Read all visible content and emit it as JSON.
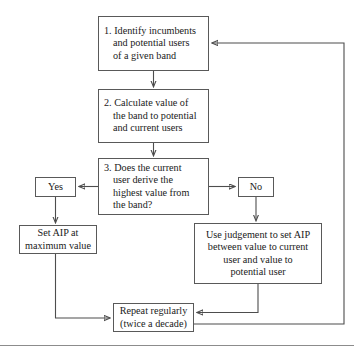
{
  "diagram": {
    "type": "flowchart",
    "background_color": "#ffffff",
    "border_color": "#595959",
    "line_color": "#4d4d4d",
    "text_color": "#1a1a1a",
    "nodes": [
      {
        "id": "identify",
        "label": "1. Identify incumbents\nand potential users\nof a given band",
        "shape": "rectangle",
        "role": "process"
      },
      {
        "id": "calculate",
        "label": "2. Calculate value of\nthe band to potential\nand current users",
        "shape": "rectangle",
        "role": "process"
      },
      {
        "id": "decision",
        "label": "3. Does the current\nuser derive the\nhighest value from\nthe band?",
        "shape": "rectangle",
        "role": "decision"
      },
      {
        "id": "yes",
        "label": "Yes",
        "shape": "rectangle",
        "role": "branch-label"
      },
      {
        "id": "no",
        "label": "No",
        "shape": "rectangle",
        "role": "branch-label"
      },
      {
        "id": "setaip",
        "label": "Set AIP at\nmaximum value",
        "shape": "rectangle",
        "role": "action"
      },
      {
        "id": "judgement",
        "label": "Use judgement to set AIP\nbetween value to current\nuser and value to\npotential user",
        "shape": "rectangle",
        "role": "action"
      },
      {
        "id": "repeat",
        "label": "Repeat regularly\n(twice a decade)",
        "shape": "rectangle",
        "role": "loop"
      }
    ],
    "edges": [
      {
        "from": "identify",
        "to": "calculate",
        "style": "arrow-down"
      },
      {
        "from": "calculate",
        "to": "decision",
        "style": "arrow-down"
      },
      {
        "from": "decision",
        "to": "yes",
        "style": "arrow-left"
      },
      {
        "from": "decision",
        "to": "no",
        "style": "arrow-right"
      },
      {
        "from": "yes",
        "to": "setaip",
        "style": "arrow-down"
      },
      {
        "from": "no",
        "to": "judgement",
        "style": "arrow-down"
      },
      {
        "from": "setaip",
        "to": "repeat",
        "style": "elbow-down-right-arrow"
      },
      {
        "from": "judgement",
        "to": "repeat",
        "style": "elbow-down-left-arrow"
      },
      {
        "from": "repeat",
        "to": "identify",
        "style": "feedback-right-up-left-arrow"
      }
    ]
  }
}
